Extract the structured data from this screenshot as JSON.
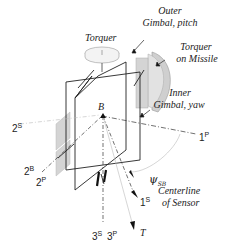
{
  "labels": {
    "torquer": "Torquer",
    "outer_gimbal_line1": "Outer",
    "outer_gimbal_line2": "Gimbal, pitch",
    "torquer_missile_line1": "Torquer",
    "torquer_missile_line2": "on Missile",
    "inner_gimbal_line1": "Inner",
    "inner_gimbal_line2": "Gimbal, yaw",
    "point_b": "B",
    "psi_symbol": "ψ",
    "psi_sub": "SB",
    "centerline_line1": "Centerline",
    "centerline_line2": "of Sensor",
    "axis_2s": "2",
    "axis_2s_sup": "S",
    "axis_2b": "2",
    "axis_2b_sup": "B",
    "axis_2p": "2",
    "axis_2p_sup": "P",
    "axis_1p": "1",
    "axis_1p_sup": "P",
    "axis_1s": "1",
    "axis_1s_sup": "S",
    "axis_3s": "3",
    "axis_3s_sup": "S",
    "axis_3p": "3",
    "axis_3p_sup": "P",
    "axis_t": "T"
  },
  "colors": {
    "line": "#222222",
    "dash": "#444444",
    "light_line": "#bbbbbb",
    "plate_fill": "#d4d4d4",
    "disk_fill": "#f2f2f2"
  }
}
